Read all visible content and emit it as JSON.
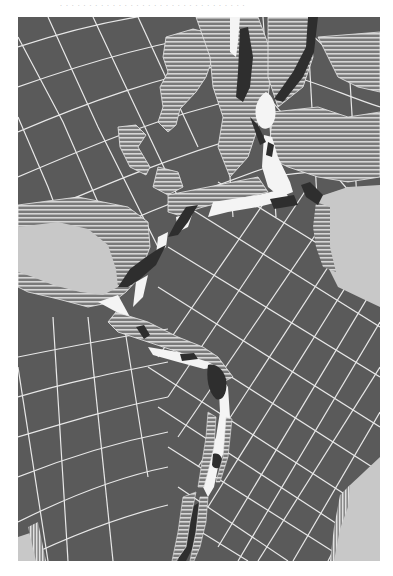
{
  "page": {
    "top_caption_fragment": ". . . . . . . . . . . . . . . . . . . . . . . . . . . . . . . ."
  },
  "map": {
    "type": "paleogeographic reconstruction",
    "subject": "Opening of the North and Central Atlantic between the Americas, Europe and Africa",
    "frame": {
      "x": 18,
      "y": 17,
      "width": 362,
      "height": 544
    },
    "colors": {
      "ocean": "#5a5a5a",
      "graticule": "#e8e8e8",
      "land_hatch_bg": "#7a7a7a",
      "land_hatch_line": "#d6d6d6",
      "shelf_light": "#c8c8c8",
      "rift_dark": "#2e2e2e",
      "rift_white": "#f4f4f4",
      "page_bg": "#ffffff"
    },
    "legend": [
      {
        "key": "ocean",
        "meaning": "Oceanic basin (dark gray with graticule)"
      },
      {
        "key": "hatched",
        "meaning": "Continental land (horizontal hatching)"
      },
      {
        "key": "light_gray",
        "meaning": "Continental interior / shelf areas"
      },
      {
        "key": "dark_fill",
        "meaning": "Rift basins / sedimentary troughs"
      },
      {
        "key": "white_fill",
        "meaning": "Rift zone / spreading axis"
      }
    ],
    "regions": [
      "North America (upper left)",
      "Greenland (upper center)",
      "Europe (upper right)",
      "Gulf of Mexico (light gray, left)",
      "Africa (light gray, right)",
      "South America (lower right, light gray)",
      "Central Atlantic rift (center)"
    ]
  }
}
